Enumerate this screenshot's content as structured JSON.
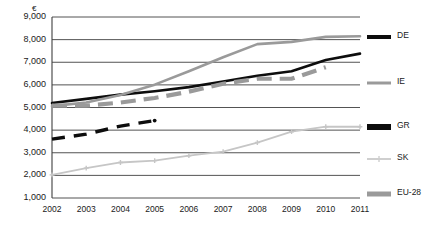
{
  "chart_data": {
    "type": "line",
    "title": "",
    "subtitle": "",
    "xlabel": "",
    "ylabel": "",
    "unit_symbol": "€",
    "categories": [
      "2002",
      "2003",
      "2004",
      "2005",
      "2006",
      "2007",
      "2008",
      "2009",
      "2010",
      "2011"
    ],
    "x": [
      2002,
      2003,
      2004,
      2005,
      2006,
      2007,
      2008,
      2009,
      2010,
      2011
    ],
    "ylim": [
      1000,
      9000
    ],
    "xlim": [
      2002,
      2011
    ],
    "y_ticks": [
      9000,
      8000,
      7000,
      6000,
      5000,
      4000,
      3000,
      2000,
      1000
    ],
    "y_tick_labels": [
      "9,000",
      "8,000",
      "7,000",
      "6,000",
      "5,000",
      "4,000",
      "3,000",
      "2,000",
      "1,000"
    ],
    "grid": true,
    "grid_axis": "y",
    "legend_position": "right",
    "series": [
      {
        "name": "DE",
        "color": "#0d0d0d",
        "style": "solid",
        "width": 2.6,
        "markers": false,
        "values": [
          5200,
          5380,
          5570,
          5720,
          5900,
          6150,
          6400,
          6600,
          7100,
          7380
        ]
      },
      {
        "name": "IE",
        "color": "#9a9a9a",
        "style": "solid",
        "width": 2.6,
        "markers": false,
        "values": [
          5060,
          5220,
          5550,
          6010,
          6600,
          7220,
          7800,
          7900,
          8120,
          8150
        ]
      },
      {
        "name": "GR",
        "color": "#0d0d0d",
        "style": "dashed",
        "width": 3.4,
        "markers": false,
        "values": [
          3600,
          3820,
          4180,
          4420,
          null,
          null,
          null,
          null,
          null,
          null
        ]
      },
      {
        "name": "SK",
        "color": "#c6c6c6",
        "style": "solid",
        "width": 1.8,
        "markers": true,
        "values": [
          2020,
          2320,
          2570,
          2650,
          2870,
          3050,
          3450,
          3930,
          4150,
          4150
        ]
      },
      {
        "name": "EU-28",
        "color": "#9a9a9a",
        "style": "dashed",
        "width": 4.2,
        "markers": false,
        "values": [
          5080,
          5080,
          5220,
          5420,
          5700,
          6050,
          6270,
          6270,
          6780,
          null
        ]
      }
    ]
  },
  "axis": {
    "unit": "€",
    "y_labels": [
      "9,000",
      "8,000",
      "7,000",
      "6,000",
      "5,000",
      "4,000",
      "3,000",
      "2,000",
      "1,000"
    ],
    "x_labels": [
      "2002",
      "2003",
      "2004",
      "2005",
      "2006",
      "2007",
      "2008",
      "2009",
      "2010",
      "2011"
    ]
  },
  "legend": {
    "items": [
      {
        "label": "DE",
        "color": "#0d0d0d",
        "style": "solid",
        "thickness": 4
      },
      {
        "label": "IE",
        "color": "#9a9a9a",
        "style": "solid",
        "thickness": 3
      },
      {
        "label": "GR",
        "color": "#0d0d0d",
        "style": "solid",
        "thickness": 6
      },
      {
        "label": "SK",
        "color": "#cfcfcf",
        "style": "marker",
        "thickness": 2
      },
      {
        "label": "EU-28",
        "color": "#9a9a9a",
        "style": "solid",
        "thickness": 5
      }
    ]
  },
  "colors": {
    "grid": "#3f3f3f",
    "axis": "#3f3f3f",
    "text": "#1a1a1a",
    "background": "#ffffff"
  }
}
